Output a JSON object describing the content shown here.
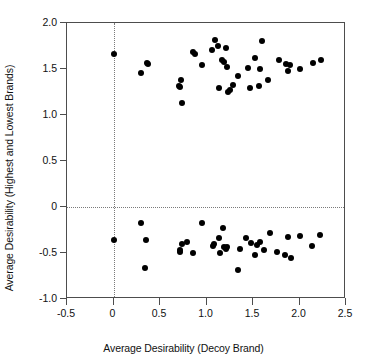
{
  "chart_data": {
    "type": "scatter",
    "title": "",
    "xlabel": "Average Desirability (Decoy Brand)",
    "ylabel": "Average Desirability (Highest and Lowest Brands)",
    "xlim": [
      -0.5,
      2.5
    ],
    "ylim": [
      -1.0,
      2.0
    ],
    "xticks": [
      -0.5,
      0,
      0.5,
      1.0,
      1.5,
      2.0,
      2.5
    ],
    "xticklabels": [
      "-0.5",
      "0",
      "0.5",
      "1.0",
      "1.5",
      "2.0",
      "2.5"
    ],
    "yticks": [
      -1.0,
      -0.5,
      0,
      0.5,
      1.0,
      1.5,
      2.0
    ],
    "yticklabels": [
      "-1.0",
      "-0.5",
      "0",
      "0.5",
      "1.0",
      "1.5",
      "2.0"
    ],
    "grid": false,
    "reference_lines": [
      {
        "axis": "y",
        "value": 0,
        "style": "dotted"
      },
      {
        "axis": "x",
        "value": 0,
        "style": "dotted"
      }
    ],
    "legend": null,
    "marker": {
      "shape": "circle",
      "color": "#000000",
      "size": 6
    },
    "series": [
      {
        "name": "Highest Brand (positive desirability)",
        "points": [
          [
            0.0,
            1.66
          ],
          [
            0.3,
            1.46
          ],
          [
            0.36,
            1.57
          ],
          [
            0.37,
            1.55
          ],
          [
            0.7,
            1.32
          ],
          [
            0.72,
            1.3
          ],
          [
            0.73,
            1.38
          ],
          [
            0.74,
            1.13
          ],
          [
            0.85,
            1.69
          ],
          [
            0.88,
            1.66
          ],
          [
            0.95,
            1.54
          ],
          [
            1.06,
            1.71
          ],
          [
            1.09,
            1.81
          ],
          [
            1.12,
            1.75
          ],
          [
            1.13,
            1.29
          ],
          [
            1.17,
            1.6
          ],
          [
            1.19,
            1.58
          ],
          [
            1.21,
            1.73
          ],
          [
            1.22,
            1.52
          ],
          [
            1.23,
            1.25
          ],
          [
            1.25,
            1.27
          ],
          [
            1.28,
            1.33
          ],
          [
            1.34,
            1.42
          ],
          [
            1.45,
            1.51
          ],
          [
            1.47,
            1.29
          ],
          [
            1.52,
            1.62
          ],
          [
            1.56,
            1.31
          ],
          [
            1.58,
            1.5
          ],
          [
            1.6,
            1.8
          ],
          [
            1.66,
            1.38
          ],
          [
            1.78,
            1.6
          ],
          [
            1.86,
            1.55
          ],
          [
            1.88,
            1.48
          ],
          [
            1.9,
            1.54
          ],
          [
            2.01,
            1.5
          ],
          [
            2.15,
            1.57
          ],
          [
            2.23,
            1.6
          ]
        ]
      },
      {
        "name": "Lowest Brand (negative desirability)",
        "points": [
          [
            0.0,
            -0.36
          ],
          [
            0.3,
            -0.17
          ],
          [
            0.35,
            -0.36
          ],
          [
            0.34,
            -0.66
          ],
          [
            0.71,
            -0.49
          ],
          [
            0.72,
            -0.47
          ],
          [
            0.74,
            -0.4
          ],
          [
            0.79,
            -0.38
          ],
          [
            0.86,
            -0.5
          ],
          [
            0.95,
            -0.17
          ],
          [
            1.07,
            -0.42
          ],
          [
            1.08,
            -0.4
          ],
          [
            1.13,
            -0.34
          ],
          [
            1.15,
            -0.5
          ],
          [
            1.18,
            -0.23
          ],
          [
            1.19,
            -0.44
          ],
          [
            1.21,
            -0.46
          ],
          [
            1.22,
            -0.43
          ],
          [
            1.34,
            -0.68
          ],
          [
            1.36,
            -0.46
          ],
          [
            1.43,
            -0.34
          ],
          [
            1.48,
            -0.39
          ],
          [
            1.52,
            -0.52
          ],
          [
            1.54,
            -0.41
          ],
          [
            1.58,
            -0.38
          ],
          [
            1.62,
            -0.47
          ],
          [
            1.68,
            -0.28
          ],
          [
            1.76,
            -0.49
          ],
          [
            1.84,
            -0.52
          ],
          [
            1.88,
            -0.33
          ],
          [
            1.91,
            -0.55
          ],
          [
            2.0,
            -0.32
          ],
          [
            2.13,
            -0.42
          ],
          [
            2.22,
            -0.3
          ]
        ]
      }
    ]
  }
}
